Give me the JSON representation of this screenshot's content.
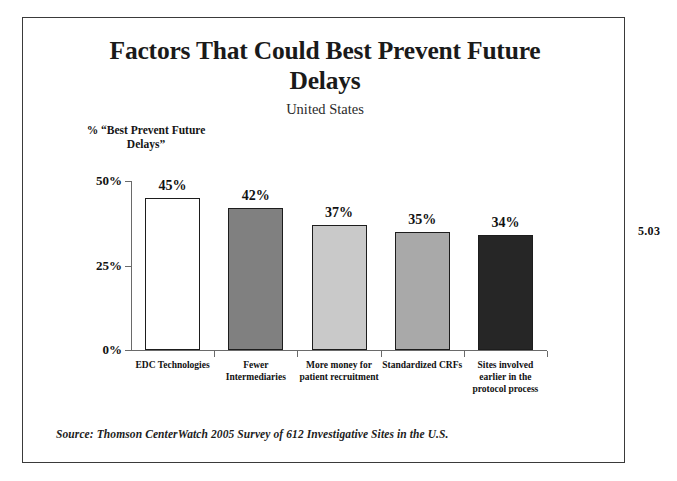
{
  "page": {
    "number": "5.03"
  },
  "chart_data": {
    "type": "bar",
    "title": "Factors That Could Best Prevent Future Delays",
    "subtitle": "United States",
    "ylabel": "% “Best Prevent Future Delays”",
    "xlabel": "",
    "categories": [
      "EDC Technologies",
      "Fewer Intermediaries",
      "More money for patient recruitment",
      "Standardized CRFs",
      "Sites involved earlier in the protocol process"
    ],
    "category_lines": [
      [
        "EDC Technologies"
      ],
      [
        "Fewer",
        "Intermediaries"
      ],
      [
        "More money for",
        "patient recruitment"
      ],
      [
        "Standardized CRFs"
      ],
      [
        "Sites involved",
        "earlier in the",
        "protocol process"
      ]
    ],
    "values": [
      45,
      42,
      37,
      35,
      34
    ],
    "value_labels": [
      "45%",
      "42%",
      "37%",
      "35%",
      "34%"
    ],
    "bar_colors": [
      "#ffffff",
      "#808080",
      "#c9c9c9",
      "#a9a9a9",
      "#262626"
    ],
    "bar_border_color": "#1d1d1d",
    "ylim": [
      0,
      50
    ],
    "yticks": [
      0,
      25,
      50
    ],
    "ytick_labels": [
      "0%",
      "25%",
      "50%"
    ],
    "grid": false,
    "legend": "none",
    "source": "Source:  Thomson CenterWatch 2005 Survey of 612 Investigative Sites in the U.S."
  }
}
